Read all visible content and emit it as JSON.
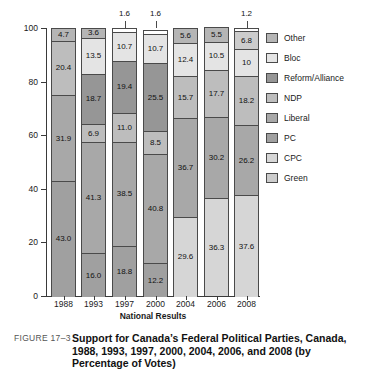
{
  "figure": {
    "number": "FIGURE 17–3",
    "caption": "Support for Canada’s Federal Political Parties, Canada, 1988, 1993, 1997, 2000, 2004, 2006, and 2008 (by Percentage of Votes)"
  },
  "chart_data": {
    "type": "bar",
    "stacked": true,
    "title": "Support for Canada’s Federal Political Parties, Canada, 1988, 1993, 1997, 2000, 2004, 2006, and 2008 (by Percentage of Votes)",
    "xlabel": "National Results",
    "ylabel": "",
    "ylim": [
      0,
      100
    ],
    "yticks": [
      0,
      20,
      40,
      60,
      80,
      100
    ],
    "grid": false,
    "legend_position": "right",
    "categories": [
      "1988",
      "1993",
      "1997",
      "2000",
      "2004",
      "2006",
      "2008"
    ],
    "legend": [
      "Other",
      "Bloc",
      "Reform/Alliance",
      "NDP",
      "Liberal",
      "PC",
      "CPC",
      "Green"
    ],
    "colors": {
      "Other": "#b5b5b5",
      "Bloc": "#e4e4e4",
      "Reform/Alliance": "#969696",
      "NDP": "#bdbdbd",
      "Liberal": "#a8a8a8",
      "PC": "#a0a0a0",
      "CPC": "#d6d6d6",
      "Green": "#cccccc"
    },
    "series": [
      {
        "name": "PC",
        "values": [
          43.0,
          16.0,
          18.8,
          12.2,
          null,
          null,
          null
        ]
      },
      {
        "name": "CPC",
        "values": [
          null,
          null,
          null,
          null,
          29.6,
          36.3,
          37.6
        ]
      },
      {
        "name": "Liberal",
        "values": [
          31.9,
          41.3,
          38.5,
          40.8,
          36.7,
          30.2,
          26.2
        ]
      },
      {
        "name": "NDP",
        "values": [
          20.4,
          6.9,
          11.0,
          8.5,
          15.7,
          17.7,
          18.2
        ]
      },
      {
        "name": "Reform/Alliance",
        "values": [
          null,
          18.7,
          19.4,
          25.5,
          null,
          null,
          null
        ]
      },
      {
        "name": "Bloc",
        "values": [
          null,
          13.5,
          10.7,
          10.7,
          12.4,
          10.5,
          10.0
        ]
      },
      {
        "name": "Green",
        "values": [
          null,
          null,
          null,
          null,
          null,
          null,
          6.8
        ]
      },
      {
        "name": "Other",
        "values": [
          4.7,
          3.6,
          1.6,
          1.6,
          5.6,
          5.5,
          1.2
        ]
      }
    ],
    "bars": [
      {
        "year": "1988",
        "segments": [
          {
            "party": "PC",
            "value": 43.0,
            "label": "43.0",
            "color": "#a0a0a0",
            "callout": false
          },
          {
            "party": "Liberal",
            "value": 31.9,
            "label": "31.9",
            "color": "#a8a8a8",
            "callout": false
          },
          {
            "party": "NDP",
            "value": 20.4,
            "label": "20.4",
            "color": "#bdbdbd",
            "callout": false
          },
          {
            "party": "Other",
            "value": 4.7,
            "label": "4.7",
            "color": "#b5b5b5",
            "callout": false
          }
        ]
      },
      {
        "year": "1993",
        "segments": [
          {
            "party": "PC",
            "value": 16.0,
            "label": "16.0",
            "color": "#a0a0a0",
            "callout": false
          },
          {
            "party": "Liberal",
            "value": 41.3,
            "label": "41.3",
            "color": "#a8a8a8",
            "callout": false
          },
          {
            "party": "NDP",
            "value": 6.9,
            "label": "6.9",
            "color": "#bdbdbd",
            "callout": false
          },
          {
            "party": "Reform/Alliance",
            "value": 18.7,
            "label": "18.7",
            "color": "#969696",
            "callout": false
          },
          {
            "party": "Bloc",
            "value": 13.5,
            "label": "13.5",
            "color": "#e4e4e4",
            "callout": false
          },
          {
            "party": "Other",
            "value": 3.6,
            "label": "3.6",
            "color": "#b5b5b5",
            "callout": false
          }
        ]
      },
      {
        "year": "1997",
        "segments": [
          {
            "party": "PC",
            "value": 18.8,
            "label": "18.8",
            "color": "#a0a0a0",
            "callout": false
          },
          {
            "party": "Liberal",
            "value": 38.5,
            "label": "38.5",
            "color": "#a8a8a8",
            "callout": false
          },
          {
            "party": "NDP",
            "value": 11.0,
            "label": "11.0",
            "color": "#bdbdbd",
            "callout": false
          },
          {
            "party": "Reform/Alliance",
            "value": 19.4,
            "label": "19.4",
            "color": "#969696",
            "callout": false
          },
          {
            "party": "Bloc",
            "value": 10.7,
            "label": "10.7",
            "color": "#e4e4e4",
            "callout": false
          },
          {
            "party": "Other",
            "value": 1.6,
            "label": "1.6",
            "color": "#ffffff",
            "callout": true
          }
        ]
      },
      {
        "year": "2000",
        "segments": [
          {
            "party": "PC",
            "value": 12.2,
            "label": "12.2",
            "color": "#a0a0a0",
            "callout": false
          },
          {
            "party": "Liberal",
            "value": 40.8,
            "label": "40.8",
            "color": "#a8a8a8",
            "callout": false
          },
          {
            "party": "NDP",
            "value": 8.5,
            "label": "8.5",
            "color": "#bdbdbd",
            "callout": false
          },
          {
            "party": "Reform/Alliance",
            "value": 25.5,
            "label": "25.5",
            "color": "#969696",
            "callout": false
          },
          {
            "party": "Bloc",
            "value": 10.7,
            "label": "10.7",
            "color": "#e4e4e4",
            "callout": false
          },
          {
            "party": "Other",
            "value": 1.6,
            "label": "1.6",
            "color": "#ffffff",
            "callout": true
          }
        ]
      },
      {
        "year": "2004",
        "segments": [
          {
            "party": "CPC",
            "value": 29.6,
            "label": "29.6",
            "color": "#d6d6d6",
            "callout": false
          },
          {
            "party": "Liberal",
            "value": 36.7,
            "label": "36.7",
            "color": "#a8a8a8",
            "callout": false
          },
          {
            "party": "NDP",
            "value": 15.7,
            "label": "15.7",
            "color": "#bdbdbd",
            "callout": false
          },
          {
            "party": "Bloc",
            "value": 12.4,
            "label": "12.4",
            "color": "#e4e4e4",
            "callout": false
          },
          {
            "party": "Other",
            "value": 5.6,
            "label": "5.6",
            "color": "#b5b5b5",
            "callout": false
          }
        ]
      },
      {
        "year": "2006",
        "segments": [
          {
            "party": "CPC",
            "value": 36.3,
            "label": "36.3",
            "color": "#d6d6d6",
            "callout": false
          },
          {
            "party": "Liberal",
            "value": 30.2,
            "label": "30.2",
            "color": "#a8a8a8",
            "callout": false
          },
          {
            "party": "NDP",
            "value": 17.7,
            "label": "17.7",
            "color": "#bdbdbd",
            "callout": false
          },
          {
            "party": "Bloc",
            "value": 10.5,
            "label": "10.5",
            "color": "#e4e4e4",
            "callout": false
          },
          {
            "party": "Other",
            "value": 5.5,
            "label": "5.5",
            "color": "#b5b5b5",
            "callout": false
          }
        ]
      },
      {
        "year": "2008",
        "segments": [
          {
            "party": "CPC",
            "value": 37.6,
            "label": "37.6",
            "color": "#d6d6d6",
            "callout": false
          },
          {
            "party": "Liberal",
            "value": 26.2,
            "label": "26.2",
            "color": "#a8a8a8",
            "callout": false
          },
          {
            "party": "NDP",
            "value": 18.2,
            "label": "18.2",
            "color": "#bdbdbd",
            "callout": false
          },
          {
            "party": "Bloc",
            "value": 10.0,
            "label": "10",
            "color": "#e4e4e4",
            "callout": false
          },
          {
            "party": "Green",
            "value": 6.8,
            "label": "6.8",
            "color": "#cccccc",
            "callout": false
          },
          {
            "party": "Other",
            "value": 1.2,
            "label": "1.2",
            "color": "#ffffff",
            "callout": true
          }
        ]
      }
    ]
  }
}
